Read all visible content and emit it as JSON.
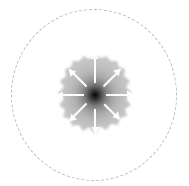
{
  "figure": {
    "width": 189,
    "height": 186,
    "background_color": "#ffffff",
    "top_cut_text": "",
    "caption": ""
  },
  "boundary": {
    "name": "outer boundary",
    "shape": "circle",
    "style": "dashed",
    "color": "#b9b9b9",
    "center_x": 94,
    "center_y": 95,
    "radius_x": 83,
    "radius_y": 86
  },
  "blob": {
    "name": "collapsing cloud",
    "center_x": 95,
    "center_y": 95,
    "radius": 39,
    "center_color": "#050505",
    "mid_color": "#8c8c8c",
    "edge_color": "#c6c6c6",
    "edge_style": "fuzzy irregular"
  },
  "arrows": {
    "name": "infall arrows",
    "count": 8,
    "color": "#fdfdfd",
    "direction": "inward",
    "items": [
      {
        "label": "arrow-east",
        "angle_deg": 0,
        "start_radius": 38,
        "end_radius": 11
      },
      {
        "label": "arrow-southeast",
        "angle_deg": 45,
        "start_radius": 36,
        "end_radius": 12
      },
      {
        "label": "arrow-south",
        "angle_deg": 90,
        "start_radius": 42,
        "end_radius": 12
      },
      {
        "label": "arrow-southwest",
        "angle_deg": 135,
        "start_radius": 36,
        "end_radius": 12
      },
      {
        "label": "arrow-west",
        "angle_deg": 180,
        "start_radius": 38,
        "end_radius": 11
      },
      {
        "label": "arrow-northwest",
        "angle_deg": 225,
        "start_radius": 34,
        "end_radius": 13
      },
      {
        "label": "arrow-north",
        "angle_deg": 270,
        "start_radius": 38,
        "end_radius": 14
      },
      {
        "label": "arrow-northeast",
        "angle_deg": 315,
        "start_radius": 36,
        "end_radius": 12
      }
    ]
  },
  "chart_data": {
    "type": "scatter",
    "title": "",
    "xlabel": "",
    "ylabel": "",
    "legend": [],
    "grid": false,
    "annotations": [
      "dashed circular boundary",
      "central dark condensation",
      "eight white infall arrows pointing to center"
    ]
  }
}
